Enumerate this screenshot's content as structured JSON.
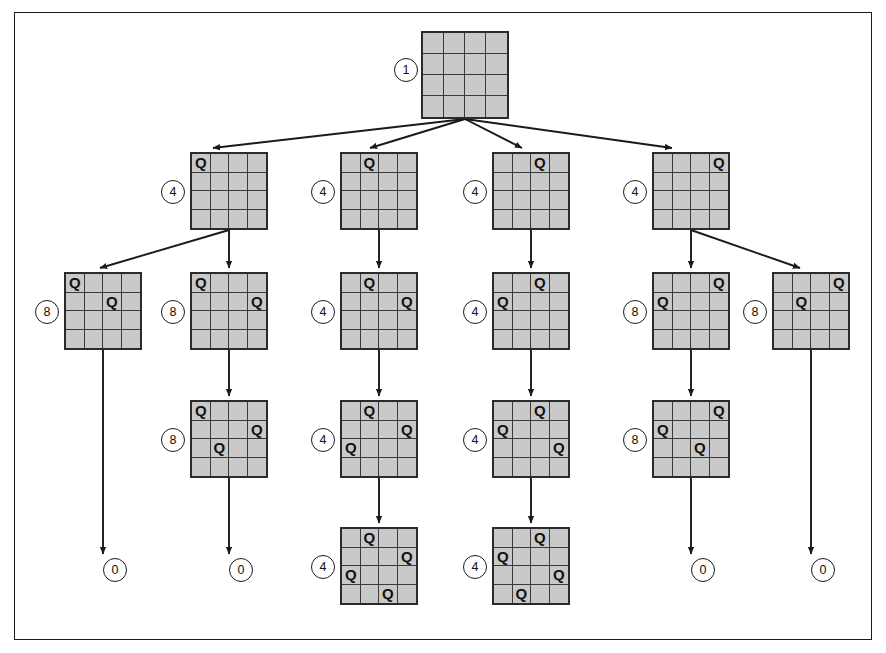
{
  "figure": {
    "board_size": 4,
    "queen_glyph": "Q",
    "colors": {
      "board_fill": "#c9c9c9",
      "board_border": "#2b2b2b",
      "grid_line": "#3a3a3a",
      "edge": "#1a1a1a",
      "frame": "#1a1a1a",
      "label_bg": "#ffffff",
      "text": "#111111"
    }
  },
  "nodes": [
    {
      "id": "n0",
      "label": "1",
      "level": 0,
      "x": 421,
      "y": 31,
      "size": 88,
      "cell": 22,
      "label_pos": {
        "x": 394,
        "y": 58
      },
      "queens": []
    },
    {
      "id": "n1",
      "label": "4",
      "level": 1,
      "x": 190,
      "y": 152,
      "size": 78,
      "cell": 19.5,
      "label_pos": {
        "x": 161,
        "y": 180
      },
      "queens": [
        {
          "row": 0,
          "col": 0
        }
      ]
    },
    {
      "id": "n2",
      "label": "4",
      "level": 1,
      "x": 340,
      "y": 152,
      "size": 78,
      "cell": 19.5,
      "label_pos": {
        "x": 311,
        "y": 180
      },
      "queens": [
        {
          "row": 0,
          "col": 1
        }
      ]
    },
    {
      "id": "n3",
      "label": "4",
      "level": 1,
      "x": 492,
      "y": 152,
      "size": 78,
      "cell": 19.5,
      "label_pos": {
        "x": 463,
        "y": 180
      },
      "queens": [
        {
          "row": 0,
          "col": 2
        }
      ]
    },
    {
      "id": "n4",
      "label": "4",
      "level": 1,
      "x": 652,
      "y": 152,
      "size": 78,
      "cell": 19.5,
      "label_pos": {
        "x": 623,
        "y": 180
      },
      "queens": [
        {
          "row": 0,
          "col": 3
        }
      ]
    },
    {
      "id": "n5",
      "label": "8",
      "level": 2,
      "x": 64,
      "y": 272,
      "size": 78,
      "cell": 19.5,
      "label_pos": {
        "x": 35,
        "y": 300
      },
      "queens": [
        {
          "row": 0,
          "col": 0
        },
        {
          "row": 1,
          "col": 2
        }
      ]
    },
    {
      "id": "n6",
      "label": "8",
      "level": 2,
      "x": 190,
      "y": 272,
      "size": 78,
      "cell": 19.5,
      "label_pos": {
        "x": 161,
        "y": 300
      },
      "queens": [
        {
          "row": 0,
          "col": 0
        },
        {
          "row": 1,
          "col": 3
        }
      ]
    },
    {
      "id": "n7",
      "label": "4",
      "level": 2,
      "x": 340,
      "y": 272,
      "size": 78,
      "cell": 19.5,
      "label_pos": {
        "x": 311,
        "y": 300
      },
      "queens": [
        {
          "row": 0,
          "col": 1
        },
        {
          "row": 1,
          "col": 3
        }
      ]
    },
    {
      "id": "n8",
      "label": "4",
      "level": 2,
      "x": 492,
      "y": 272,
      "size": 78,
      "cell": 19.5,
      "label_pos": {
        "x": 463,
        "y": 300
      },
      "queens": [
        {
          "row": 0,
          "col": 2
        },
        {
          "row": 1,
          "col": 0
        }
      ]
    },
    {
      "id": "n9",
      "label": "8",
      "level": 2,
      "x": 652,
      "y": 272,
      "size": 78,
      "cell": 19.5,
      "label_pos": {
        "x": 623,
        "y": 300
      },
      "queens": [
        {
          "row": 0,
          "col": 3
        },
        {
          "row": 1,
          "col": 0
        }
      ]
    },
    {
      "id": "n10",
      "label": "8",
      "level": 2,
      "x": 772,
      "y": 272,
      "size": 78,
      "cell": 19.5,
      "label_pos": {
        "x": 743,
        "y": 300
      },
      "queens": [
        {
          "row": 0,
          "col": 3
        },
        {
          "row": 1,
          "col": 1
        }
      ]
    },
    {
      "id": "n11",
      "label": "8",
      "level": 3,
      "x": 190,
      "y": 400,
      "size": 78,
      "cell": 19.5,
      "label_pos": {
        "x": 161,
        "y": 428
      },
      "queens": [
        {
          "row": 0,
          "col": 0
        },
        {
          "row": 1,
          "col": 3
        },
        {
          "row": 2,
          "col": 1
        }
      ]
    },
    {
      "id": "n12",
      "label": "4",
      "level": 3,
      "x": 340,
      "y": 400,
      "size": 78,
      "cell": 19.5,
      "label_pos": {
        "x": 311,
        "y": 428
      },
      "queens": [
        {
          "row": 0,
          "col": 1
        },
        {
          "row": 1,
          "col": 3
        },
        {
          "row": 2,
          "col": 0
        }
      ]
    },
    {
      "id": "n13",
      "label": "4",
      "level": 3,
      "x": 492,
      "y": 400,
      "size": 78,
      "cell": 19.5,
      "label_pos": {
        "x": 463,
        "y": 428
      },
      "queens": [
        {
          "row": 0,
          "col": 2
        },
        {
          "row": 1,
          "col": 0
        },
        {
          "row": 2,
          "col": 3
        }
      ]
    },
    {
      "id": "n14",
      "label": "8",
      "level": 3,
      "x": 652,
      "y": 400,
      "size": 78,
      "cell": 19.5,
      "label_pos": {
        "x": 623,
        "y": 428
      },
      "queens": [
        {
          "row": 0,
          "col": 3
        },
        {
          "row": 1,
          "col": 0
        },
        {
          "row": 2,
          "col": 2
        }
      ]
    },
    {
      "id": "n15",
      "label": "4",
      "level": 4,
      "x": 340,
      "y": 527,
      "size": 78,
      "cell": 19.5,
      "label_pos": {
        "x": 311,
        "y": 555
      },
      "queens": [
        {
          "row": 0,
          "col": 1
        },
        {
          "row": 1,
          "col": 3
        },
        {
          "row": 2,
          "col": 0
        },
        {
          "row": 3,
          "col": 2
        }
      ]
    },
    {
      "id": "n16",
      "label": "4",
      "level": 4,
      "x": 492,
      "y": 527,
      "size": 78,
      "cell": 19.5,
      "label_pos": {
        "x": 463,
        "y": 555
      },
      "queens": [
        {
          "row": 0,
          "col": 2
        },
        {
          "row": 1,
          "col": 0
        },
        {
          "row": 2,
          "col": 3
        },
        {
          "row": 3,
          "col": 1
        }
      ]
    }
  ],
  "terminals": [
    {
      "id": "t1",
      "label": "0",
      "x": 103,
      "y": 558
    },
    {
      "id": "t2",
      "label": "0",
      "x": 229,
      "y": 558
    },
    {
      "id": "t3",
      "label": "0",
      "x": 691,
      "y": 558
    },
    {
      "id": "t4",
      "label": "0",
      "x": 811,
      "y": 558
    }
  ],
  "edges": [
    {
      "from": "n0",
      "to": "n1",
      "x1": 465,
      "y1": 119,
      "x2": 213,
      "y2": 148
    },
    {
      "from": "n0",
      "to": "n2",
      "x1": 465,
      "y1": 119,
      "x2": 370,
      "y2": 148
    },
    {
      "from": "n0",
      "to": "n3",
      "x1": 465,
      "y1": 119,
      "x2": 522,
      "y2": 148
    },
    {
      "from": "n0",
      "to": "n4",
      "x1": 465,
      "y1": 119,
      "x2": 672,
      "y2": 148
    },
    {
      "from": "n1",
      "to": "n5",
      "x1": 229,
      "y1": 230,
      "x2": 100,
      "y2": 268
    },
    {
      "from": "n1",
      "to": "n6",
      "x1": 229,
      "y1": 230,
      "x2": 229,
      "y2": 268
    },
    {
      "from": "n2",
      "to": "n7",
      "x1": 379,
      "y1": 230,
      "x2": 379,
      "y2": 268
    },
    {
      "from": "n3",
      "to": "n8",
      "x1": 531,
      "y1": 230,
      "x2": 531,
      "y2": 268
    },
    {
      "from": "n4",
      "to": "n9",
      "x1": 691,
      "y1": 230,
      "x2": 691,
      "y2": 268
    },
    {
      "from": "n4",
      "to": "n10",
      "x1": 691,
      "y1": 230,
      "x2": 800,
      "y2": 268
    },
    {
      "from": "n5",
      "to": "t1",
      "x1": 103,
      "y1": 350,
      "x2": 103,
      "y2": 554
    },
    {
      "from": "n6",
      "to": "n11",
      "x1": 229,
      "y1": 350,
      "x2": 229,
      "y2": 396
    },
    {
      "from": "n7",
      "to": "n12",
      "x1": 379,
      "y1": 350,
      "x2": 379,
      "y2": 396
    },
    {
      "from": "n8",
      "to": "n13",
      "x1": 531,
      "y1": 350,
      "x2": 531,
      "y2": 396
    },
    {
      "from": "n9",
      "to": "n14",
      "x1": 691,
      "y1": 350,
      "x2": 691,
      "y2": 396
    },
    {
      "from": "n10",
      "to": "t4",
      "x1": 811,
      "y1": 350,
      "x2": 811,
      "y2": 554
    },
    {
      "from": "n11",
      "to": "t2",
      "x1": 229,
      "y1": 478,
      "x2": 229,
      "y2": 554
    },
    {
      "from": "n12",
      "to": "n15",
      "x1": 379,
      "y1": 478,
      "x2": 379,
      "y2": 523
    },
    {
      "from": "n13",
      "to": "n16",
      "x1": 531,
      "y1": 478,
      "x2": 531,
      "y2": 523
    },
    {
      "from": "n14",
      "to": "t3",
      "x1": 691,
      "y1": 478,
      "x2": 691,
      "y2": 554
    }
  ]
}
